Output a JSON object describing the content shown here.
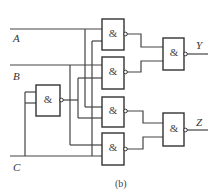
{
  "diagram": {
    "type": "logic-circuit",
    "caption": "(b)",
    "inputs": [
      {
        "id": "A",
        "label": "A"
      },
      {
        "id": "B",
        "label": "B"
      },
      {
        "id": "C",
        "label": "C"
      }
    ],
    "outputs": [
      {
        "id": "Y",
        "label": "Y"
      },
      {
        "id": "Z",
        "label": "Z"
      }
    ],
    "gates": [
      {
        "id": "G0",
        "symbol": "&",
        "type": "NAND",
        "inputs": [
          "C",
          "C"
        ],
        "role": "inverter"
      },
      {
        "id": "G1",
        "symbol": "&",
        "type": "NAND",
        "inputs": [
          "A",
          "C"
        ]
      },
      {
        "id": "G2",
        "symbol": "&",
        "type": "NAND",
        "inputs": [
          "B",
          "G0"
        ]
      },
      {
        "id": "G3",
        "symbol": "&",
        "type": "NAND",
        "inputs": [
          "A",
          "G0"
        ]
      },
      {
        "id": "G4",
        "symbol": "&",
        "type": "NAND",
        "inputs": [
          "B",
          "C"
        ]
      },
      {
        "id": "GY",
        "symbol": "&",
        "type": "NAND",
        "inputs": [
          "G1",
          "G2"
        ],
        "output": "Y"
      },
      {
        "id": "GZ",
        "symbol": "&",
        "type": "NAND",
        "inputs": [
          "G3",
          "G4"
        ],
        "output": "Z"
      }
    ]
  }
}
